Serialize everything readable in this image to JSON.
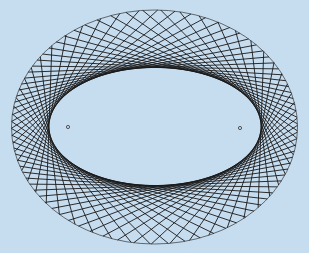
{
  "diagram": {
    "background": "#c6dcef",
    "stroke_color": "#1a1a1a",
    "outer_ellipse": {
      "cx": 154.5,
      "cy": 127,
      "rx": 143,
      "ry": 117
    },
    "inner_ellipse": {
      "cx": 155,
      "cy": 126.5,
      "rx": 106,
      "ry": 59
    },
    "foci": [
      {
        "x": 68,
        "y": 127
      },
      {
        "x": 240,
        "y": 128
      }
    ],
    "chord_count": 72
  }
}
